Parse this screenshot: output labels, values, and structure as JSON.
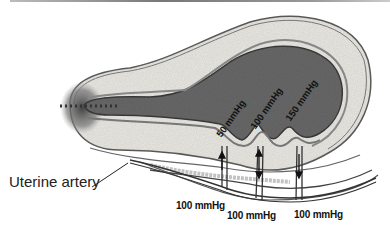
{
  "figure": {
    "labels": {
      "uterine_artery": "Uterine artery",
      "intervillous_pressures": [
        "50 mmHg",
        "100 mmHg",
        "150 mmHg"
      ],
      "arterial_pressures": [
        "100 mmHg",
        "100 mmHg",
        "100 mmHg"
      ]
    },
    "colors": {
      "cavity": "#5a5a5a",
      "wall": "#e8e6e0",
      "membrane": "#8a8a8a",
      "ink": "#222222"
    }
  }
}
